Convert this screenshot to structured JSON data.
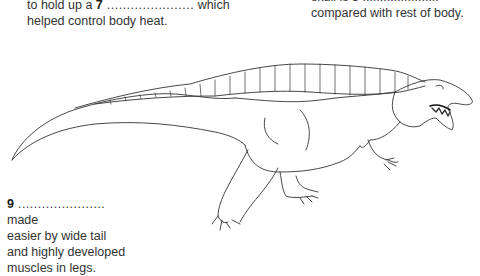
{
  "annotations": {
    "top_left": {
      "line1_prefix": "to hold up a ",
      "number": "7",
      "blank": " ......................",
      "line1_suffix": " which",
      "line2": "helped control body heat."
    },
    "top_right": {
      "line0_clipped": "skull is 8 ......................",
      "line1": "compared with rest of body."
    },
    "bottom_left": {
      "number": "9",
      "blank": " ......................",
      "suffix": " made",
      "line2": "easier by wide tail",
      "line3": "and highly developed",
      "line4": "muscles in legs."
    }
  },
  "illustration": {
    "subject": "dinosaur-line-drawing",
    "stroke_color": "#333333"
  }
}
